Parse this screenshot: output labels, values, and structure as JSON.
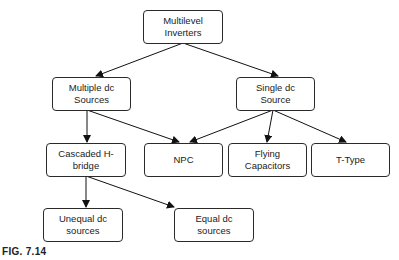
{
  "diagram": {
    "nodes": [
      {
        "id": "multilevel_inverters",
        "label": "Multilevel\nInverters"
      },
      {
        "id": "multiple_dc_sources",
        "label": "Multiple dc\nSources"
      },
      {
        "id": "single_dc_source",
        "label": "Single dc\nSource"
      },
      {
        "id": "cascaded_h_bridge",
        "label": "Cascaded H-\nbridge"
      },
      {
        "id": "npc",
        "label": "NPC"
      },
      {
        "id": "flying_capacitors",
        "label": "Flying\nCapacitors"
      },
      {
        "id": "t_type",
        "label": "T-Type"
      },
      {
        "id": "unequal_dc_sources",
        "label": "Unequal dc\nsources"
      },
      {
        "id": "equal_dc_sources",
        "label": "Equal dc\nsources"
      }
    ],
    "edges": [
      {
        "from": "multilevel_inverters",
        "to": "multiple_dc_sources"
      },
      {
        "from": "multilevel_inverters",
        "to": "single_dc_source"
      },
      {
        "from": "multiple_dc_sources",
        "to": "cascaded_h_bridge"
      },
      {
        "from": "multiple_dc_sources",
        "to": "npc"
      },
      {
        "from": "single_dc_source",
        "to": "npc"
      },
      {
        "from": "single_dc_source",
        "to": "flying_capacitors"
      },
      {
        "from": "single_dc_source",
        "to": "t_type"
      },
      {
        "from": "cascaded_h_bridge",
        "to": "unequal_dc_sources"
      },
      {
        "from": "cascaded_h_bridge",
        "to": "equal_dc_sources"
      }
    ]
  },
  "caption": "FIG. 7.14"
}
